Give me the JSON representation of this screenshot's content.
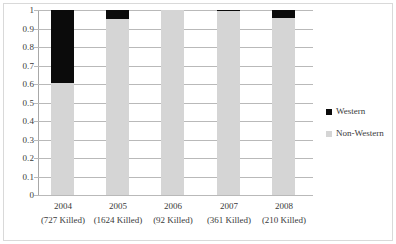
{
  "chart_data": {
    "type": "bar",
    "subtype": "stacked-100-percent",
    "title": "",
    "xlabel": "",
    "ylabel": "",
    "ylim": [
      0,
      1
    ],
    "ytick_labels": [
      "1",
      "0.9",
      "0.8",
      "0.7",
      "0.6",
      "0.5",
      "0.4",
      "0.3",
      "0.2",
      "0.1",
      "0"
    ],
    "ytick_values": [
      1,
      0.9,
      0.8,
      0.7,
      0.6,
      0.5,
      0.4,
      0.3,
      0.2,
      0.1,
      0
    ],
    "grid": true,
    "legend_position": "right",
    "categories": [
      "2004",
      "2005",
      "2006",
      "2007",
      "2008"
    ],
    "category_sublabels": [
      "(727 Killed)",
      "(1624 Killed)",
      "(92 Killed)",
      "(361 Killed)",
      "(210 Killed)"
    ],
    "category_totals": [
      727,
      1624,
      92,
      361,
      210
    ],
    "series": [
      {
        "name": "Non-Western",
        "color": "#d5d5d5",
        "values": [
          0.605,
          0.952,
          1.0,
          0.992,
          0.957
        ]
      },
      {
        "name": "Western",
        "color": "#0b0b0b",
        "values": [
          0.395,
          0.048,
          0.0,
          0.008,
          0.043
        ]
      }
    ]
  },
  "legend": {
    "items": [
      {
        "label": "Western",
        "color": "#0b0b0b"
      },
      {
        "label": "Non-Western",
        "color": "#d5d5d5"
      }
    ]
  }
}
